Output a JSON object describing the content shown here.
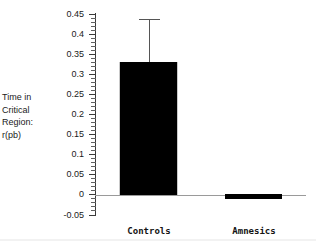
{
  "chart_data": {
    "type": "bar",
    "title": "",
    "subtitle": "",
    "xlabel": "",
    "ylabel": "Time in Critical Region: r(pb)",
    "ylabel_lines": [
      "Time in",
      "Critical",
      "Region:",
      "r(pb)"
    ],
    "categories": [
      "Controls",
      "Amnesics"
    ],
    "values": [
      0.33,
      -0.012
    ],
    "errors_upper": [
      0.107,
      0
    ],
    "errors_lower": [
      0,
      0
    ],
    "error_bar_tops": [
      0.437,
      null
    ],
    "ylim": [
      -0.05,
      0.45
    ],
    "ytick_step": 0.05,
    "yminor_per_major": 5,
    "ytick_labels": [
      "0.45",
      "0.4",
      "0.35",
      "0.3",
      "0.25",
      "0.2",
      "0.15",
      "0.1",
      "0.05",
      "0",
      "-0.05"
    ],
    "ytick_values": [
      0.45,
      0.4,
      0.35,
      0.3,
      0.25,
      0.2,
      0.15,
      0.1,
      0.05,
      0,
      -0.05
    ],
    "grid": false,
    "legend": false,
    "legend_position": "none",
    "bar_color": "#000000",
    "axis_color": "#3a3a3a",
    "baseline_color": "#9a9a9a",
    "error_bar_color": "#555555",
    "background_color": "#ffffff",
    "annotations": []
  },
  "axis": {
    "y_label_block": [
      "Time in",
      "Critical",
      "Region:",
      "r(pb)"
    ]
  }
}
